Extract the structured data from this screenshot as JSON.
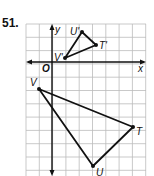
{
  "problem": {
    "number": "51."
  },
  "axes": {
    "x_label": "x",
    "y_label": "y",
    "origin_label": "O"
  },
  "grid": {
    "left": 26,
    "top": 24,
    "right": 146,
    "bottom": 176,
    "cell": 13.3,
    "color": "#bbbbbb"
  },
  "image_triangle": {
    "vertices": [
      {
        "name": "U'",
        "px": [
          82,
          32
        ]
      },
      {
        "name": "T'",
        "px": [
          96,
          45
        ]
      },
      {
        "name": "V'",
        "px": [
          65,
          58
        ]
      }
    ]
  },
  "preimage_triangle": {
    "vertices": [
      {
        "name": "V",
        "px": [
          39,
          89
        ]
      },
      {
        "name": "T",
        "px": [
          133,
          127
        ]
      },
      {
        "name": "U",
        "px": [
          93,
          166
        ]
      }
    ]
  },
  "labels": {
    "u_prime": "U'",
    "t_prime": "T'",
    "v_prime": "V'",
    "v": "V",
    "t": "T",
    "u": "U"
  }
}
